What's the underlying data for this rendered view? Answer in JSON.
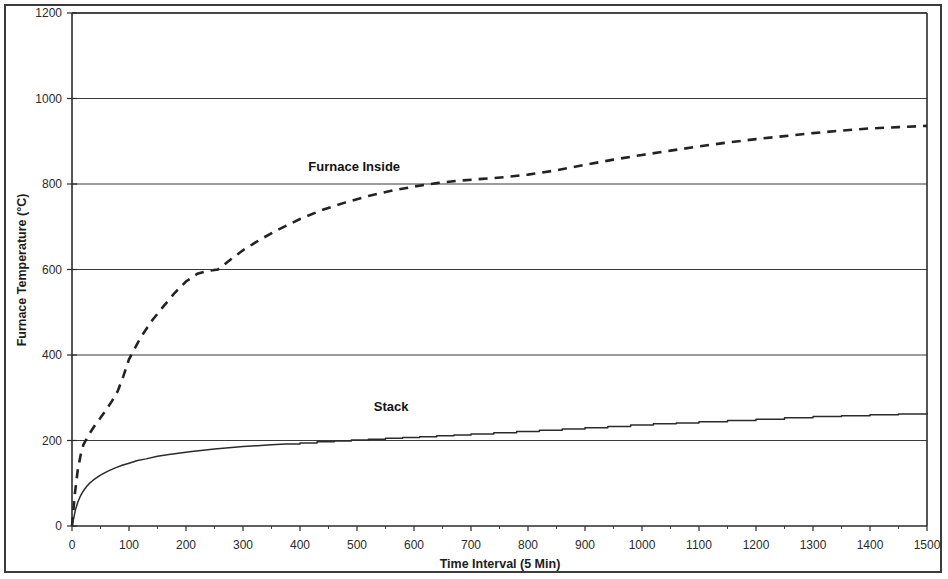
{
  "chart_data": {
    "type": "line",
    "title": "",
    "xlabel": "Time Interval (5 Min)",
    "ylabel": "Furnace Temperature (°C)",
    "xlim": [
      0,
      1500
    ],
    "ylim": [
      0,
      1200
    ],
    "xticks": [
      0,
      100,
      200,
      300,
      400,
      500,
      600,
      700,
      800,
      900,
      1000,
      1100,
      1200,
      1300,
      1400,
      1500
    ],
    "yticks": [
      0,
      200,
      400,
      600,
      800,
      1000,
      1200
    ],
    "grid": "horizontal",
    "legend": "inline-labels",
    "series": [
      {
        "name": "Furnace Inside",
        "style": "dashed",
        "label_x": 495,
        "label_y": 830,
        "x": [
          0,
          5,
          10,
          15,
          20,
          30,
          40,
          50,
          60,
          70,
          80,
          90,
          100,
          120,
          140,
          160,
          180,
          200,
          220,
          240,
          256,
          280,
          300,
          330,
          360,
          400,
          440,
          480,
          520,
          560,
          600,
          640,
          680,
          720,
          760,
          800,
          850,
          900,
          950,
          1000,
          1050,
          1100,
          1150,
          1200,
          1250,
          1300,
          1350,
          1400,
          1450,
          1500
        ],
        "y": [
          0,
          75,
          130,
          165,
          190,
          215,
          235,
          253,
          272,
          292,
          315,
          350,
          390,
          440,
          480,
          513,
          545,
          572,
          590,
          597,
          600,
          625,
          645,
          670,
          692,
          718,
          740,
          757,
          772,
          784,
          794,
          802,
          808,
          812,
          816,
          822,
          832,
          845,
          857,
          868,
          878,
          888,
          897,
          905,
          912,
          919,
          925,
          930,
          933,
          936
        ]
      },
      {
        "name": "Stack",
        "style": "solid-step",
        "label_x": 560,
        "label_y": 270,
        "x": [
          0,
          3,
          6,
          10,
          14,
          18,
          22,
          26,
          30,
          36,
          42,
          50,
          58,
          66,
          76,
          88,
          100,
          115,
          130,
          150,
          170,
          190,
          210,
          230,
          250,
          275,
          300,
          325,
          350,
          375,
          400,
          430,
          460,
          490,
          520,
          550,
          580,
          610,
          640,
          670,
          700,
          740,
          780,
          820,
          860,
          900,
          940,
          980,
          1020,
          1060,
          1100,
          1150,
          1200,
          1250,
          1300,
          1350,
          1400,
          1450,
          1500
        ],
        "y": [
          0,
          18,
          38,
          55,
          68,
          78,
          86,
          93,
          99,
          106,
          112,
          119,
          125,
          130,
          136,
          142,
          147,
          153,
          157,
          163,
          167,
          171,
          174,
          177,
          180,
          183,
          186,
          188,
          190,
          192,
          194,
          197,
          199,
          201,
          203,
          205,
          207,
          209,
          211,
          213,
          215,
          218,
          221,
          224,
          227,
          230,
          233,
          236,
          239,
          241,
          244,
          247,
          250,
          253,
          256,
          258,
          260,
          262,
          263
        ]
      }
    ]
  },
  "axes": {
    "y_title": "Furnace Temperature (°C)",
    "x_title": "Time Interval (5 Min)",
    "y_tick_labels": [
      "0",
      "200",
      "400",
      "600",
      "800",
      "1000",
      "1200"
    ],
    "x_tick_labels": [
      "0",
      "100",
      "200",
      "300",
      "400",
      "500",
      "600",
      "700",
      "800",
      "900",
      "1000",
      "1100",
      "1200",
      "1300",
      "1400",
      "1500"
    ]
  },
  "series_labels": {
    "furnace_inside": "Furnace Inside",
    "stack": "Stack"
  },
  "colors": {
    "line": "#232323",
    "grid": "#3a3a3a",
    "axis": "#2b2b2b",
    "frame": "#3b3b3b",
    "background": "#ffffff"
  }
}
